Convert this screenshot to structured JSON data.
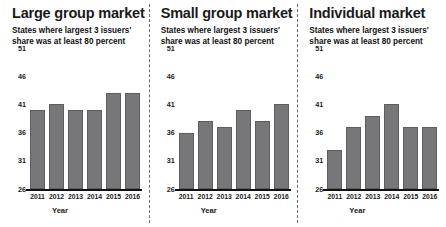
{
  "chart_data": [
    {
      "type": "bar",
      "title": "Large group market",
      "subtitle": "States where largest 3 issuers' share was at least 80 percent",
      "xlabel": "Year",
      "ylabel": "",
      "categories": [
        "2011",
        "2012",
        "2013",
        "2014",
        "2015",
        "2016"
      ],
      "values": [
        40,
        41,
        40,
        40,
        43,
        43
      ],
      "ylim": [
        26,
        51
      ],
      "yticks": [
        26,
        31,
        36,
        41,
        46,
        51
      ],
      "grid": false,
      "legend": "none",
      "bar_color": "#77777a"
    },
    {
      "type": "bar",
      "title": "Small group market",
      "subtitle": "States where largest 3 issuers' share was at least 80 percent",
      "xlabel": "Year",
      "ylabel": "",
      "categories": [
        "2011",
        "2012",
        "2013",
        "2014",
        "2015",
        "2016"
      ],
      "values": [
        36,
        38,
        37,
        40,
        38,
        41
      ],
      "ylim": [
        26,
        51
      ],
      "yticks": [
        26,
        31,
        36,
        41,
        46,
        51
      ],
      "grid": false,
      "legend": "none",
      "bar_color": "#77777a"
    },
    {
      "type": "bar",
      "title": "Individual market",
      "subtitle": "States where largest 3 issuers' share was at least 80 percent",
      "xlabel": "Year",
      "ylabel": "",
      "categories": [
        "2011",
        "2012",
        "2013",
        "2014",
        "2015",
        "2016"
      ],
      "values": [
        33,
        37,
        39,
        41,
        37,
        37
      ],
      "ylim": [
        26,
        51
      ],
      "yticks": [
        26,
        31,
        36,
        41,
        46,
        51
      ],
      "grid": false,
      "legend": "none",
      "bar_color": "#77777a"
    }
  ]
}
